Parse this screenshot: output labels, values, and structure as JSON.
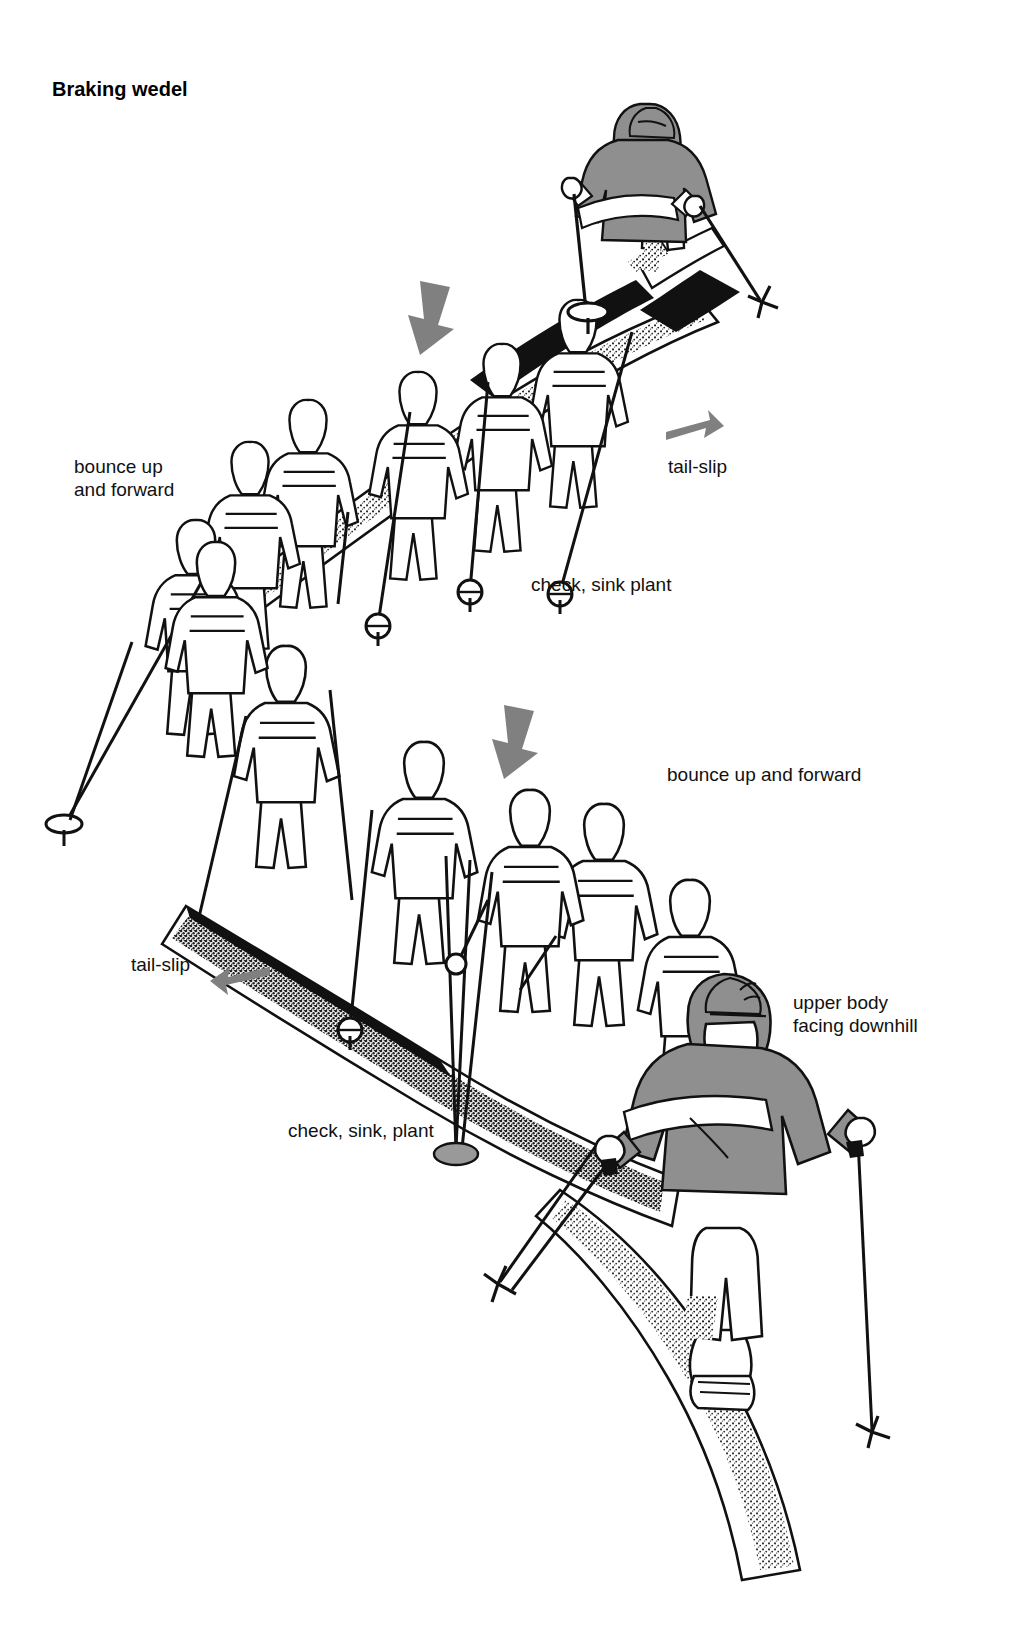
{
  "figure": {
    "title": "Braking wedel",
    "title_pos": {
      "x": 52,
      "y": 78
    },
    "type": "technical-illustration",
    "palette": {
      "ink": "#111111",
      "paper": "#ffffff",
      "arrow_gray": "#808080",
      "garment_gray": "#909090",
      "garment_highlight": "#ffffff",
      "snow_spray": "#2a2a2a"
    },
    "labels": [
      {
        "id": "bounce-up-and-forward-upper",
        "text": "bounce up\nand forward",
        "x": 74,
        "y": 455,
        "align": "left"
      },
      {
        "id": "tail-slip-upper",
        "text": "tail-slip",
        "x": 668,
        "y": 455,
        "align": "left"
      },
      {
        "id": "check-sink-plant-upper",
        "text": "check, sink plant",
        "x": 531,
        "y": 573,
        "align": "left"
      },
      {
        "id": "bounce-up-and-forward-lower",
        "text": "bounce up and forward",
        "x": 667,
        "y": 763,
        "align": "left"
      },
      {
        "id": "tail-slip-lower",
        "text": "tail-slip",
        "x": 131,
        "y": 953,
        "align": "left"
      },
      {
        "id": "upper-body-facing-downhill",
        "text": "upper body\nfacing downhill",
        "x": 793,
        "y": 991,
        "align": "left"
      },
      {
        "id": "check-sink-plant-lower",
        "text": "check, sink, plant",
        "x": 288,
        "y": 1119,
        "align": "left"
      }
    ],
    "arrows": [
      {
        "id": "arrow-down-upper",
        "x": 408,
        "y": 281,
        "w": 48,
        "h": 54,
        "direction": "down-left",
        "color": "#808080"
      },
      {
        "id": "arrow-right-upper",
        "x": 666,
        "y": 420,
        "w": 56,
        "h": 26,
        "direction": "right",
        "color": "#808080"
      },
      {
        "id": "arrow-down-lower",
        "x": 492,
        "y": 705,
        "w": 48,
        "h": 54,
        "direction": "down-left",
        "color": "#808080"
      },
      {
        "id": "arrow-left-lower",
        "x": 208,
        "y": 975,
        "w": 62,
        "h": 26,
        "direction": "left",
        "color": "#808080"
      }
    ],
    "solid_skiers": [
      {
        "id": "skier-top",
        "cx": 668,
        "cy": 200,
        "garment": "gray-sweater-white-stripe",
        "cap": "gray"
      },
      {
        "id": "skier-bottom",
        "cx": 735,
        "cy": 1250,
        "garment": "gray-sweater-white-stripe",
        "cap": "gray"
      }
    ],
    "ghost_figure_count": 12,
    "turn_sequences": 2
  }
}
